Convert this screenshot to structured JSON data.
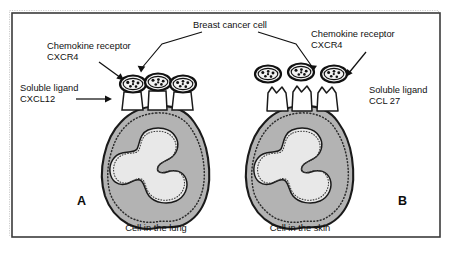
{
  "figure": {
    "frame_color": "#3b3b3b",
    "background_color": "#ffffff",
    "cell_body_color": "#b3b3b3",
    "nucleus_color": "#e8e8e8",
    "outline_color": "#1a1a1a"
  },
  "labels": {
    "breast_cancer_cell": "Breast cancer cell",
    "chemokine_receptor_left_line1": "Chemokine receptor",
    "chemokine_receptor_left_line2": "CXCR4",
    "chemokine_receptor_right_line1": "Chemokine receptor",
    "chemokine_receptor_right_line2": "CXCR4",
    "soluble_ligand_left_line1": "Soluble ligand",
    "soluble_ligand_left_line2": "CXCL12",
    "soluble_ligand_right_line1": "Soluble ligand",
    "soluble_ligand_right_line2": "CCL 27"
  },
  "panels": [
    {
      "id": "A",
      "letter": "A",
      "caption": "Cell in the lung",
      "ligand": "CXCL12",
      "receptor": "CXCR4",
      "cancer_cell_count": 3,
      "receptor_count": 3,
      "binding_state": "bound"
    },
    {
      "id": "B",
      "letter": "B",
      "caption": "Cell in the skin",
      "ligand": "CCL 27",
      "receptor": "CXCR4",
      "cancer_cell_count": 3,
      "receptor_count": 3,
      "binding_state": "unbound"
    }
  ],
  "icons": {
    "arrow": "arrow-pointer-icon",
    "cancer_cell": "breast-cancer-cell-icon",
    "receptor": "chemokine-receptor-icon",
    "host_cell": "host-cell-icon"
  }
}
